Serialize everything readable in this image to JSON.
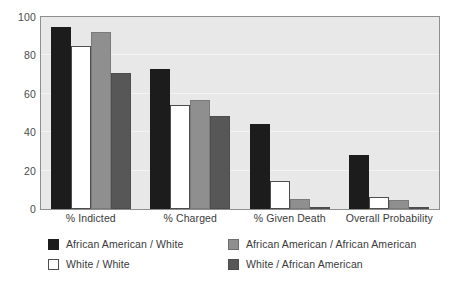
{
  "chart_data": {
    "type": "bar",
    "title": "",
    "subtitle": "",
    "xlabel": "",
    "ylabel": "",
    "categories": [
      "% Indicted",
      "% Charged",
      "% Given Death",
      "Overall Probability"
    ],
    "series": [
      {
        "name": "African American / White",
        "color": "#1c1c1c",
        "values": [
          95,
          73,
          44.5,
          28
        ]
      },
      {
        "name": "White / White",
        "color": "#ffffff",
        "values": [
          85,
          54,
          14.5,
          6
        ]
      },
      {
        "name": "African American / African American",
        "color": "#8f8f8f",
        "values": [
          92,
          57,
          5,
          4.5
        ]
      },
      {
        "name": "White / African American",
        "color": "#575757",
        "values": [
          71,
          48.5,
          1,
          1
        ]
      }
    ],
    "ylim": [
      0,
      100
    ],
    "yticks": [
      0,
      20,
      40,
      60,
      80,
      100
    ],
    "ytick_labels": [
      "0",
      "20",
      "40",
      "60",
      "80",
      "100"
    ],
    "grid": true,
    "legend_position": "bottom",
    "plot_background": "#e8e8e8",
    "frame_color": "#8e8e8e",
    "gridline_color": "#f4f4f4"
  }
}
